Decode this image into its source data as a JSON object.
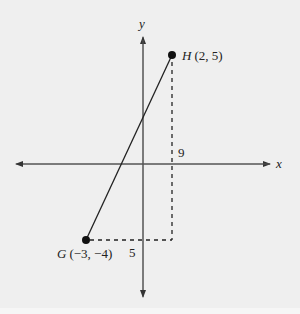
{
  "diagram": {
    "type": "coordinate-plane",
    "axes": {
      "x_label": "x",
      "y_label": "y"
    },
    "points": [
      {
        "name": "H",
        "coords": "(2, 5)",
        "x": 2,
        "y": 5
      },
      {
        "name": "G",
        "coords": "(−3, −4)",
        "x": -3,
        "y": -4
      }
    ],
    "segment": {
      "from": "G",
      "to": "H"
    },
    "right_triangle_legs": {
      "vertical": {
        "label": "9"
      },
      "horizontal": {
        "label": "5"
      }
    }
  },
  "colors": {
    "background": "#efefef",
    "ink": "#222222"
  }
}
